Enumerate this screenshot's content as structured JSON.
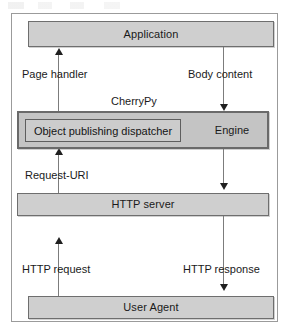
{
  "diagram": {
    "colors": {
      "node_fill": "#cfcfcf",
      "band_fill": "#c4c4c4",
      "node_border": "#6e6e6e",
      "band_border": "#6a6a6a",
      "frame_border": "#9b9b9b",
      "connector": "#7c7c7c",
      "arrowhead": "#1f1f1f",
      "text": "#1a1a1a",
      "background": "#ffffff"
    },
    "nodes": [
      {
        "id": "application",
        "label": "Application"
      },
      {
        "id": "cherrypy",
        "label": "CherryPy"
      },
      {
        "id": "dispatcher",
        "label": "Object publishing dispatcher"
      },
      {
        "id": "engine",
        "label": "Engine"
      },
      {
        "id": "http_server",
        "label": "HTTP server"
      },
      {
        "id": "user_agent",
        "label": "User Agent"
      }
    ],
    "edges": [
      {
        "id": "page_handler",
        "label": "Page handler",
        "from": "dispatcher",
        "to": "application",
        "direction": "up"
      },
      {
        "id": "body_content",
        "label": "Body content",
        "from": "application",
        "to": "engine",
        "direction": "down"
      },
      {
        "id": "request_uri",
        "label": "Request-URI",
        "from": "http_server",
        "to": "dispatcher",
        "direction": "up"
      },
      {
        "id": "engine_out",
        "label": "",
        "from": "engine",
        "to": "http_server",
        "direction": "down"
      },
      {
        "id": "http_request",
        "label": "HTTP request",
        "from": "user_agent",
        "to": "http_server",
        "direction": "up"
      },
      {
        "id": "http_response",
        "label": "HTTP response",
        "from": "http_server",
        "to": "user_agent",
        "direction": "down"
      }
    ]
  }
}
